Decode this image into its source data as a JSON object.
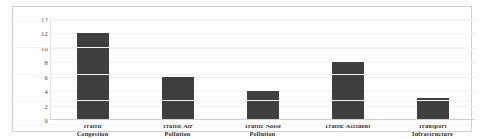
{
  "chart_data": {
    "type": "bar",
    "title": "",
    "xlabel": "",
    "ylabel": "",
    "ylim": [
      0,
      14
    ],
    "grid": true,
    "legend": "none",
    "bar_color": "#3f3f3f",
    "categories": [
      "Traffic Congestion",
      "Traffic Air Pollution",
      "Traffic Noise Pollution",
      "Traffic Accident",
      "Transport Infrastructure"
    ],
    "category_lines": [
      [
        "Traffic",
        "Congestion"
      ],
      [
        "Traffic Air",
        "Pollution"
      ],
      [
        "Traffic Noise",
        "Pollution"
      ],
      [
        "Traffic Accident",
        ""
      ],
      [
        "Transport",
        "Infrastructure"
      ]
    ],
    "values": [
      12,
      6,
      4,
      8,
      3
    ],
    "yticks": [
      14,
      12,
      10,
      8,
      6,
      4,
      2,
      0
    ],
    "ytick_labels": [
      "14",
      "12",
      "10",
      "8",
      "6",
      "4",
      "2",
      "0"
    ]
  }
}
